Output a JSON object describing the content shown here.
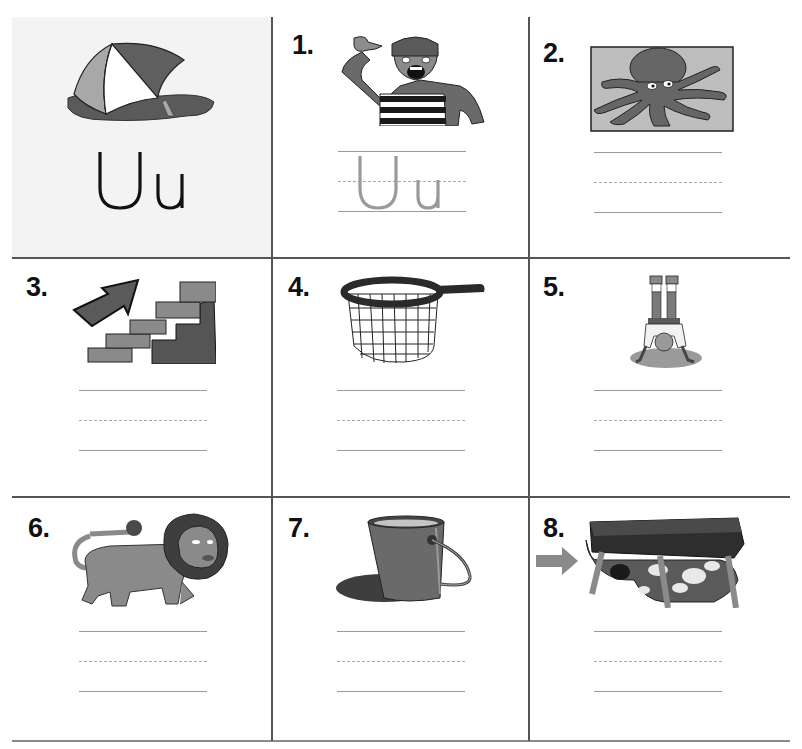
{
  "worksheet": {
    "letter": "Uu",
    "key_picture": "umbrella",
    "traced_example": "Uu",
    "colors": {
      "grid_line": "#555555",
      "key_cell_bg": "#f3f3f3",
      "writing_line": "#9a9a9a",
      "trace_letter": "#9a9a9a",
      "illustration_dark": "#555555",
      "illustration_mid": "#8a8a8a",
      "illustration_light": "#bdbdbd"
    },
    "items": [
      {
        "number": "1.",
        "picture": "mime-pointing-at-self",
        "has_trace": true
      },
      {
        "number": "2.",
        "picture": "octopus"
      },
      {
        "number": "3.",
        "picture": "stairs-with-up-arrow"
      },
      {
        "number": "4.",
        "picture": "net"
      },
      {
        "number": "5.",
        "picture": "upside-down-handstand"
      },
      {
        "number": "6.",
        "picture": "lion"
      },
      {
        "number": "7.",
        "picture": "bucket"
      },
      {
        "number": "8.",
        "picture": "dog-under-table"
      }
    ]
  }
}
